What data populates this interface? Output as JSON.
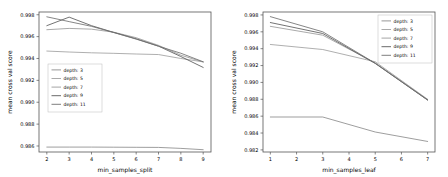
{
  "figure": {
    "background": "#ffffff",
    "panel_count": 2
  },
  "chart_data": [
    {
      "type": "line",
      "title": "",
      "xlabel": "min_samples_split",
      "ylabel": "mean cross val score",
      "x": [
        2,
        3,
        4,
        5,
        6,
        7,
        8,
        9
      ],
      "xlim": [
        1.65,
        9.35
      ],
      "ylim": [
        0.98545,
        0.99825
      ],
      "xticks": [
        2,
        3,
        4,
        5,
        6,
        7,
        8,
        9
      ],
      "xtick_labels": [
        "2",
        "3",
        "4",
        "5",
        "6",
        "7",
        "8",
        "9"
      ],
      "yticks": [
        0.986,
        0.988,
        0.99,
        0.992,
        0.994,
        0.996,
        0.998
      ],
      "ytick_labels": [
        "0.986",
        "0.988",
        "0.990",
        "0.992",
        "0.994",
        "0.996",
        "0.998"
      ],
      "grid": false,
      "legend_position": "center-left",
      "series": [
        {
          "name": "depth: 3",
          "color": "#8c8c8c",
          "values": [
            0.9859,
            0.9859,
            0.9859,
            0.98589,
            0.98588,
            0.98587,
            0.98578,
            0.98566
          ]
        },
        {
          "name": "depth: 5",
          "color": "#a0a0a0",
          "values": [
            0.99468,
            0.99459,
            0.99452,
            0.99447,
            0.99441,
            0.99436,
            0.994,
            0.99369
          ]
        },
        {
          "name": "depth: 7",
          "color": "#9a9a9a",
          "values": [
            0.99663,
            0.99675,
            0.99668,
            0.9964,
            0.9959,
            0.9952,
            0.9943,
            0.99368
          ]
        },
        {
          "name": "depth: 9",
          "color": "#5a5a5a",
          "values": [
            0.997,
            0.99778,
            0.997,
            0.99638,
            0.9958,
            0.99513,
            0.99418,
            0.99318
          ]
        },
        {
          "name": "depth: 11",
          "color": "#707070",
          "values": [
            0.99781,
            0.99737,
            0.99694,
            0.99637,
            0.99577,
            0.99512,
            0.99448,
            0.9937
          ]
        }
      ]
    },
    {
      "type": "line",
      "title": "",
      "xlabel": "min_samples_leaf",
      "ylabel": "mean cross val score",
      "x": [
        1,
        3,
        5,
        7
      ],
      "xlim": [
        0.72,
        7.28
      ],
      "ylim": [
        0.98175,
        0.99835
      ],
      "xticks": [
        1,
        2,
        3,
        4,
        5,
        6,
        7
      ],
      "xtick_labels": [
        "1",
        "2",
        "3",
        "4",
        "5",
        "6",
        "7"
      ],
      "yticks": [
        0.982,
        0.984,
        0.986,
        0.988,
        0.99,
        0.992,
        0.994,
        0.996,
        0.998
      ],
      "ytick_labels": [
        "0.982",
        "0.984",
        "0.986",
        "0.988",
        "0.990",
        "0.992",
        "0.994",
        "0.996",
        "0.998"
      ],
      "grid": false,
      "legend_position": "upper-right",
      "series": [
        {
          "name": "depth: 3",
          "color": "#8c8c8c",
          "values": [
            0.9859,
            0.9859,
            0.98412,
            0.983
          ]
        },
        {
          "name": "depth: 5",
          "color": "#a0a0a0",
          "values": [
            0.9945,
            0.9939,
            0.99245,
            0.988
          ]
        },
        {
          "name": "depth: 7",
          "color": "#9a9a9a",
          "values": [
            0.99665,
            0.9956,
            0.9923,
            0.98795
          ]
        },
        {
          "name": "depth: 9",
          "color": "#5a5a5a",
          "values": [
            0.9971,
            0.9958,
            0.99225,
            0.9879
          ]
        },
        {
          "name": "depth: 11",
          "color": "#707070",
          "values": [
            0.9978,
            0.996,
            0.99228,
            0.98792
          ]
        }
      ]
    }
  ]
}
